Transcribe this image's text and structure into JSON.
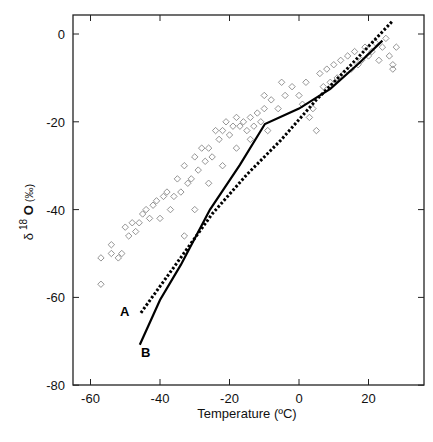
{
  "chart_data": {
    "type": "scatter",
    "title": "",
    "xlabel": "Temperature (ºC)",
    "ylabel": "δ 18 O (‰)",
    "xlim": [
      -66,
      34
    ],
    "ylim": [
      -80,
      5
    ],
    "xticks": [
      -60,
      -40,
      -20,
      0,
      20
    ],
    "yticks": [
      0,
      -20,
      -40,
      -60,
      -80
    ],
    "grid": false,
    "legend": "none",
    "annotations": [
      {
        "text": "A",
        "x": -49,
        "y": -63
      },
      {
        "text": "B",
        "x": -43,
        "y": -72.5
      }
    ],
    "series": [
      {
        "name": "Observations",
        "marker": "open-diamond",
        "color": "#888888",
        "points": [
          [
            -57,
            -57
          ],
          [
            -57,
            -51
          ],
          [
            -54,
            -50
          ],
          [
            -54,
            -48
          ],
          [
            -52,
            -51
          ],
          [
            -51,
            -50
          ],
          [
            -50,
            -44
          ],
          [
            -49,
            -46
          ],
          [
            -48,
            -43
          ],
          [
            -47,
            -45
          ],
          [
            -46,
            -43
          ],
          [
            -45,
            -41
          ],
          [
            -44,
            -40
          ],
          [
            -43,
            -42
          ],
          [
            -42,
            -39
          ],
          [
            -41,
            -38
          ],
          [
            -40,
            -42
          ],
          [
            -39,
            -37
          ],
          [
            -38,
            -36
          ],
          [
            -37,
            -40
          ],
          [
            -36,
            -37
          ],
          [
            -35,
            -33
          ],
          [
            -34,
            -36
          ],
          [
            -33,
            -30
          ],
          [
            -32,
            -34
          ],
          [
            -31,
            -33
          ],
          [
            -30,
            -28
          ],
          [
            -29,
            -31
          ],
          [
            -28,
            -26
          ],
          [
            -27,
            -29
          ],
          [
            -26,
            -26
          ],
          [
            -25,
            -28
          ],
          [
            -24,
            -22
          ],
          [
            -23,
            -24
          ],
          [
            -22,
            -22
          ],
          [
            -21,
            -20
          ],
          [
            -20,
            -23
          ],
          [
            -19,
            -21
          ],
          [
            -18,
            -19
          ],
          [
            -17,
            -21
          ],
          [
            -16,
            -20
          ],
          [
            -15,
            -22
          ],
          [
            -14,
            -19
          ],
          [
            -13,
            -21
          ],
          [
            -12,
            -18
          ],
          [
            -11,
            -20
          ],
          [
            -10,
            -17
          ],
          [
            -9,
            -22
          ],
          [
            -8,
            -15
          ],
          [
            -6,
            -17
          ],
          [
            -4,
            -14
          ],
          [
            -2,
            -12
          ],
          [
            0,
            -14
          ],
          [
            1,
            -16
          ],
          [
            2,
            -11
          ],
          [
            3,
            -19
          ],
          [
            4,
            -17
          ],
          [
            5,
            -22
          ],
          [
            6,
            -9
          ],
          [
            7,
            -12
          ],
          [
            8,
            -8
          ],
          [
            9,
            -11
          ],
          [
            10,
            -7
          ],
          [
            11,
            -10
          ],
          [
            12,
            -6
          ],
          [
            13,
            -9
          ],
          [
            14,
            -5
          ],
          [
            15,
            -8
          ],
          [
            16,
            -4
          ],
          [
            17,
            -7
          ],
          [
            18,
            -6
          ],
          [
            19,
            -3
          ],
          [
            20,
            -5
          ],
          [
            21,
            -4
          ],
          [
            22,
            -2
          ],
          [
            23,
            -6
          ],
          [
            24,
            -3
          ],
          [
            25,
            -1
          ],
          [
            26,
            -5
          ],
          [
            27,
            -7
          ],
          [
            28,
            -3
          ],
          [
            27,
            -8
          ],
          [
            -33,
            -46
          ],
          [
            -30,
            -40
          ],
          [
            -26,
            -34
          ],
          [
            -22,
            -30
          ],
          [
            -18,
            -26
          ],
          [
            -14,
            -24
          ],
          [
            -10,
            -14
          ],
          [
            -5,
            -11
          ]
        ]
      },
      {
        "name": "A",
        "style": "dotted",
        "color": "#000000",
        "points": [
          [
            -45.5,
            -63.5
          ],
          [
            -35,
            -52
          ],
          [
            -25,
            -41
          ],
          [
            -15,
            -32
          ],
          [
            -5,
            -24
          ],
          [
            5,
            -15
          ],
          [
            15,
            -7
          ],
          [
            27,
            3
          ]
        ]
      },
      {
        "name": "B",
        "style": "solid",
        "color": "#000000",
        "points": [
          [
            -45.8,
            -70.8
          ],
          [
            -40,
            -60.6
          ],
          [
            -34,
            -52.6
          ],
          [
            -25.6,
            -40
          ],
          [
            -17,
            -29.8
          ],
          [
            -9.8,
            -20.5
          ],
          [
            0,
            -17
          ],
          [
            9,
            -12.5
          ],
          [
            17.5,
            -6.5
          ],
          [
            24,
            -1.5
          ]
        ]
      }
    ]
  }
}
